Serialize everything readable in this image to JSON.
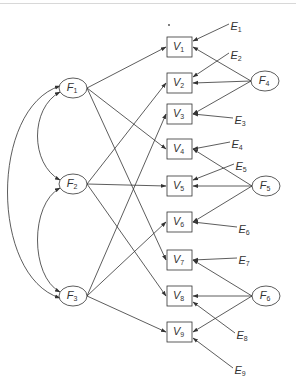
{
  "diagram": {
    "type": "structural-equation-model",
    "factors": [
      {
        "id": "F1",
        "label": "F",
        "sub": "1",
        "cx": 73,
        "cy": 88
      },
      {
        "id": "F2",
        "label": "F",
        "sub": "2",
        "cx": 73,
        "cy": 184
      },
      {
        "id": "F3",
        "label": "F",
        "sub": "3",
        "cx": 73,
        "cy": 296
      },
      {
        "id": "F4",
        "label": "F",
        "sub": "4",
        "cx": 265,
        "cy": 81
      },
      {
        "id": "F5",
        "label": "F",
        "sub": "5",
        "cx": 266,
        "cy": 186
      },
      {
        "id": "F6",
        "label": "F",
        "sub": "6",
        "cx": 266,
        "cy": 296
      }
    ],
    "variables": [
      {
        "id": "V1",
        "label": "V",
        "sub": "1",
        "y": 37
      },
      {
        "id": "V2",
        "label": "V",
        "sub": "2",
        "y": 73
      },
      {
        "id": "V3",
        "label": "V",
        "sub": "3",
        "y": 104
      },
      {
        "id": "V4",
        "label": "V",
        "sub": "4",
        "y": 139
      },
      {
        "id": "V5",
        "label": "V",
        "sub": "5",
        "y": 176
      },
      {
        "id": "V6",
        "label": "V",
        "sub": "6",
        "y": 212
      },
      {
        "id": "V7",
        "label": "V",
        "sub": "7",
        "y": 250
      },
      {
        "id": "V8",
        "label": "V",
        "sub": "8",
        "y": 286
      },
      {
        "id": "V9",
        "label": "V",
        "sub": "9",
        "y": 322
      }
    ],
    "errors": [
      {
        "id": "E1",
        "label": "E",
        "sub": "1",
        "x": 232,
        "y": 28
      },
      {
        "id": "E2",
        "label": "E",
        "sub": "2",
        "x": 232,
        "y": 57
      },
      {
        "id": "E3",
        "label": "E",
        "sub": "3",
        "x": 236,
        "y": 122
      },
      {
        "id": "E4",
        "label": "E",
        "sub": "4",
        "x": 233,
        "y": 146
      },
      {
        "id": "E5",
        "label": "E",
        "sub": "5",
        "x": 237,
        "y": 168
      },
      {
        "id": "E6",
        "label": "E",
        "sub": "6",
        "x": 240,
        "y": 231
      },
      {
        "id": "E7",
        "label": "E",
        "sub": "7",
        "x": 240,
        "y": 262
      },
      {
        "id": "E8",
        "label": "E",
        "sub": "8",
        "x": 238,
        "y": 337
      },
      {
        "id": "E9",
        "label": "E",
        "sub": "9",
        "x": 236,
        "y": 372
      }
    ],
    "paths": [
      [
        "F1",
        "V1"
      ],
      [
        "F1",
        "V4"
      ],
      [
        "F1",
        "V7"
      ],
      [
        "F2",
        "V2"
      ],
      [
        "F2",
        "V5"
      ],
      [
        "F2",
        "V8"
      ],
      [
        "F3",
        "V3"
      ],
      [
        "F3",
        "V6"
      ],
      [
        "F3",
        "V9"
      ],
      [
        "F4",
        "V1"
      ],
      [
        "F4",
        "V2"
      ],
      [
        "F4",
        "V3"
      ],
      [
        "F5",
        "V4"
      ],
      [
        "F5",
        "V5"
      ],
      [
        "F5",
        "V6"
      ],
      [
        "F6",
        "V7"
      ],
      [
        "F6",
        "V8"
      ],
      [
        "F6",
        "V9"
      ]
    ],
    "error_paths": [
      [
        "E1",
        "V1"
      ],
      [
        "E2",
        "V2"
      ],
      [
        "E3",
        "V3"
      ],
      [
        "E4",
        "V4"
      ],
      [
        "E5",
        "V5"
      ],
      [
        "E6",
        "V6"
      ],
      [
        "E7",
        "V7"
      ],
      [
        "E8",
        "V8"
      ],
      [
        "E9",
        "V9"
      ]
    ],
    "covariances": [
      [
        "F1",
        "F2"
      ],
      [
        "F2",
        "F3"
      ],
      [
        "F1",
        "F3"
      ]
    ],
    "colors": {
      "line": "#333333",
      "background": "#ffffff"
    }
  }
}
